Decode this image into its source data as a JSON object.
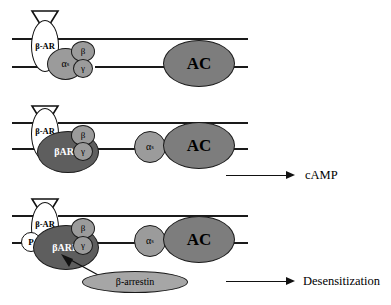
{
  "diagram": {
    "colors": {
      "receptor_fill": "#ffffff",
      "g_subunit_fill": "#9b9b9b",
      "bark_fill": "#5e5e5e",
      "ac_fill": "#7d7d7d",
      "arrestin_fill": "#a6a6a6",
      "stroke": "#1a1a1a"
    }
  },
  "panels": [
    {
      "id": "panel-basal",
      "receptor_label": "β-AR",
      "ligand": "triangle-ligand",
      "alpha_label": "α",
      "alpha_sub": "s",
      "beta_label": "β",
      "gamma_label": "γ",
      "ac_label": "AC",
      "output_label": "",
      "has_output_arrow": false
    },
    {
      "id": "panel-activated",
      "receptor_label": "β-AR",
      "ligand": "triangle-ligand",
      "bark_label": "βARK",
      "alpha_label": "α",
      "alpha_sub": "s",
      "beta_label": "β",
      "gamma_label": "γ",
      "ac_label": "AC",
      "output_label": "cAMP",
      "has_output_arrow": true
    },
    {
      "id": "panel-desensitized",
      "receptor_label": "β-AR",
      "ligand": "triangle-ligand",
      "phosphate_label": "P",
      "bark_label": "βARK",
      "alpha_label": "α",
      "alpha_sub": "s",
      "beta_label": "β",
      "gamma_label": "γ",
      "ac_label": "AC",
      "arrestin_label": "β-arrestin",
      "output_label": "Desensitization",
      "has_output_arrow": true
    }
  ]
}
